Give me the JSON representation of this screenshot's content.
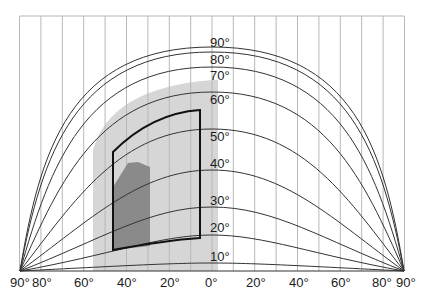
{
  "diagram": {
    "type": "sky-chart-equal-projection",
    "colors": {
      "background": "#ffffff",
      "grid": "#b8b8b8",
      "curve": "#333333",
      "outer_shade": "#d6d6d6",
      "frame": "#111111",
      "inner_shade": "#8a8a8a"
    },
    "x_axis_labels": [
      "90°",
      "80°",
      "60°",
      "40°",
      "20°",
      "0°",
      "20°",
      "40°",
      "60°",
      "80°",
      "90°"
    ],
    "altitude_labels": [
      "90°",
      "80°",
      "70°",
      "60°",
      "50°",
      "40°",
      "30°",
      "20°",
      "10°"
    ]
  }
}
